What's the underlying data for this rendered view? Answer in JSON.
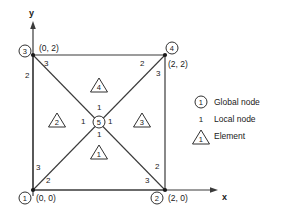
{
  "figure": {
    "type": "finite-element-mesh-diagram",
    "axes": {
      "x_label": "x",
      "y_label": "y",
      "x_axis": "horizontal-arrow",
      "y_axis": "vertical-arrow"
    },
    "global_nodes": [
      {
        "id": "1",
        "coord": "(0, 0)",
        "position": "bottom-left"
      },
      {
        "id": "2",
        "coord": "(2, 0)",
        "position": "bottom-right"
      },
      {
        "id": "3",
        "coord": "(0, 2)",
        "position": "top-left"
      },
      {
        "id": "4",
        "coord": "(2, 2)",
        "position": "top-right"
      },
      {
        "id": "5",
        "coord": "",
        "position": "center"
      }
    ],
    "elements": [
      {
        "id": "1",
        "position": "bottom"
      },
      {
        "id": "2",
        "position": "left"
      },
      {
        "id": "3",
        "position": "right"
      },
      {
        "id": "4",
        "position": "top"
      }
    ],
    "local_nodes": [
      {
        "value": "3",
        "near": "node-3",
        "place": "diagonal-upper-left"
      },
      {
        "value": "2",
        "near": "node-3",
        "place": "left-edge-upper"
      },
      {
        "value": "2",
        "near": "node-4",
        "place": "diagonal-upper-right"
      },
      {
        "value": "3",
        "near": "node-4",
        "place": "right-edge-upper"
      },
      {
        "value": "3",
        "near": "node-1",
        "place": "left-edge-lower"
      },
      {
        "value": "2",
        "near": "node-1",
        "place": "bottom-edge-left"
      },
      {
        "value": "2",
        "near": "node-2",
        "place": "right-edge-lower"
      },
      {
        "value": "3",
        "near": "node-2",
        "place": "bottom-edge-right"
      },
      {
        "value": "1",
        "near": "node-5",
        "place": "above"
      },
      {
        "value": "1",
        "near": "node-5",
        "place": "below"
      },
      {
        "value": "1",
        "near": "node-5",
        "place": "left"
      },
      {
        "value": "1",
        "near": "node-5",
        "place": "right"
      }
    ],
    "legend": [
      {
        "symbol": "1",
        "symbol_style": "circled",
        "label": "Global node"
      },
      {
        "symbol": "1",
        "symbol_style": "plain",
        "label": "Local node"
      },
      {
        "symbol": "1",
        "symbol_style": "triangle",
        "label": "Element"
      }
    ],
    "colors": {
      "line": "#3a3a3a",
      "text": "#1a1a1a",
      "background": "#ffffff"
    }
  }
}
